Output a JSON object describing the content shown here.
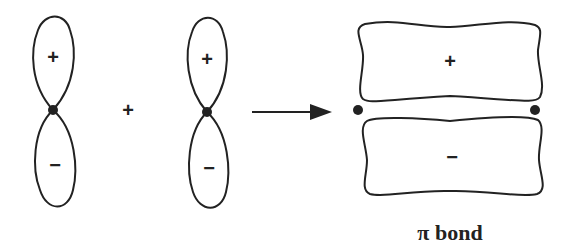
{
  "diagram": {
    "orbital_1": {
      "top_sign": "+",
      "bottom_sign": "−"
    },
    "operator": "+",
    "orbital_2": {
      "top_sign": "+",
      "bottom_sign": "−"
    },
    "result": {
      "top_sign": "+",
      "bottom_sign": "−",
      "label": "π bond"
    },
    "colors": {
      "stroke": "#222222",
      "background": "#ffffff"
    }
  }
}
